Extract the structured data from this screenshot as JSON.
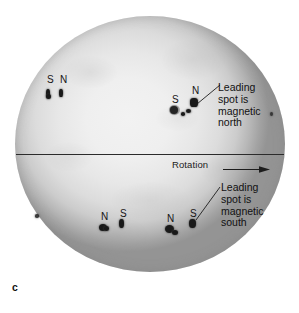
{
  "figure": {
    "letter": "c",
    "caption_label": "c"
  },
  "sun": {
    "name": "solar-disk",
    "center_color": "#f0f0f0",
    "limb_color": "#949494",
    "equator_line_color": "#2b2b2b"
  },
  "rotation": {
    "label": "Rotation",
    "arrow_direction": "right"
  },
  "callouts": [
    {
      "id": "northern-hemisphere-callout",
      "lines": [
        "Leading",
        "spot is",
        "magnetic",
        "north"
      ],
      "line1": "Leading",
      "line2": "spot is",
      "line3": "magnetic",
      "line4": "north"
    },
    {
      "id": "southern-hemisphere-callout",
      "lines": [
        "Leading",
        "spot is",
        "magnetic",
        "south"
      ],
      "line1": "Leading",
      "line2": "spot is",
      "line3": "magnetic",
      "line4": "south"
    }
  ],
  "spot_groups": [
    {
      "id": "north-west-group",
      "hemisphere": "northern",
      "leading_label": "N",
      "trailing_label": "S",
      "left_letter": "S",
      "right_letter": "N"
    },
    {
      "id": "north-east-group",
      "hemisphere": "northern",
      "leading_label": "N",
      "trailing_label": "S",
      "left_letter": "S",
      "right_letter": "N"
    },
    {
      "id": "south-west-group",
      "hemisphere": "southern",
      "leading_label": "S",
      "trailing_label": "N",
      "left_letter": "N",
      "right_letter": "S"
    },
    {
      "id": "south-east-group",
      "hemisphere": "southern",
      "leading_label": "S",
      "trailing_label": "N",
      "left_letter": "N",
      "right_letter": "S"
    }
  ],
  "polarity_letters": {
    "nw_left": "S",
    "nw_right": "N",
    "ne_left": "S",
    "ne_right": "N",
    "sw_left": "N",
    "sw_right": "S",
    "se_left": "N",
    "se_right": "S"
  }
}
